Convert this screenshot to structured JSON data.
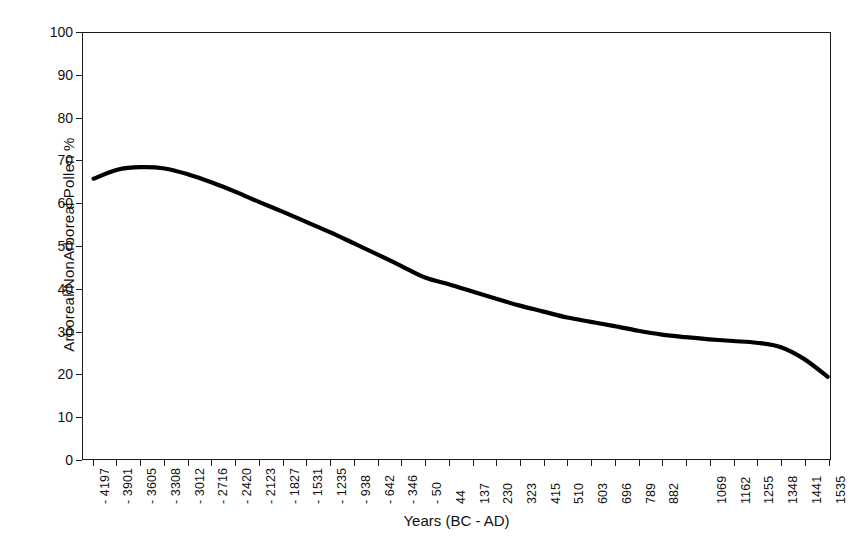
{
  "chart_data": {
    "type": "line",
    "title": "",
    "xlabel": "Years (BC - AD)",
    "ylabel": "Arboreal/NonArboreal Pollen %",
    "ylim": [
      0,
      100
    ],
    "ytick_labels": [
      "100",
      "90",
      "80",
      "70",
      "60",
      "50",
      "40",
      "30",
      "20",
      "10",
      "0"
    ],
    "ytick_values": [
      100,
      90,
      80,
      70,
      60,
      50,
      40,
      30,
      20,
      10,
      0
    ],
    "grid": false,
    "legend": "none",
    "xtick_labels": [
      "- 4197",
      "- 3901",
      "- 3605",
      "- 3308",
      "- 3012",
      "- 2716",
      "- 2420",
      "- 2123",
      "- 1827",
      "- 1531",
      "- 1235",
      "- 938",
      "- 642",
      "- 346",
      "- 50",
      "44",
      "137",
      "230",
      "323",
      "415",
      "510",
      "603",
      "696",
      "789",
      "882",
      "",
      "1069",
      "1162",
      "1255",
      "1348",
      "1441",
      "1535"
    ],
    "categories": [
      -4197,
      -3901,
      -3605,
      -3308,
      -3012,
      -2716,
      -2420,
      -2123,
      -1827,
      -1531,
      -1235,
      -938,
      -642,
      -346,
      -50,
      44,
      137,
      230,
      323,
      415,
      510,
      603,
      696,
      789,
      882,
      975,
      1069,
      1162,
      1255,
      1348,
      1441,
      1535
    ],
    "series": [
      {
        "name": "Arboreal/NonArboreal Pollen %",
        "color": "#000000",
        "values": [
          65.8,
          67.9,
          68.5,
          68.2,
          66.8,
          64.9,
          62.7,
          60.3,
          58.0,
          55.6,
          53.2,
          50.6,
          48.0,
          45.3,
          42.6,
          41.0,
          39.3,
          37.6,
          36.0,
          34.6,
          33.2,
          32.2,
          31.2,
          30.1,
          29.2,
          28.6,
          28.1,
          27.7,
          27.3,
          26.3,
          23.5,
          19.3
        ]
      }
    ],
    "annotations": []
  }
}
